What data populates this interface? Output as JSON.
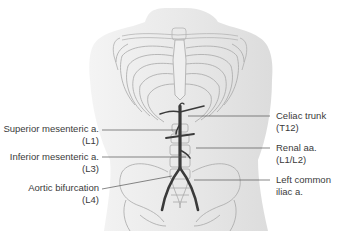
{
  "diagram": {
    "colors": {
      "background": "#ffffff",
      "body_silhouette": "#ececec",
      "bone_outline": "#a8a8a8",
      "artery": "#3a3a3a",
      "leader_line": "#555555",
      "label_text": "#3a3a3a"
    },
    "labels_left": [
      {
        "name": "Superior mesenteric a.",
        "level": "(L1)"
      },
      {
        "name": "Inferior mesenteric a.",
        "level": "(L3)"
      },
      {
        "name": "Aortic bifurcation",
        "level": "(L4)"
      }
    ],
    "labels_right": [
      {
        "name": "Celiac trunk",
        "level": "(T12)"
      },
      {
        "name": "Renal aa.",
        "level": "(L1/L2)"
      },
      {
        "name": "Left common",
        "level": "iliac a."
      }
    ]
  }
}
